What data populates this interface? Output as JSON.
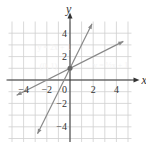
{
  "chart_data": {
    "type": "line",
    "title": "",
    "xlabel": "x",
    "ylabel": "y",
    "xlim": [
      -5.3,
      5.3
    ],
    "ylim": [
      -5.3,
      5.0
    ],
    "grid": true,
    "x_ticks": [
      {
        "v": -4,
        "label": "−4"
      },
      {
        "v": -2,
        "label": "−2"
      },
      {
        "v": 2,
        "label": "2"
      },
      {
        "v": 4,
        "label": "4"
      }
    ],
    "y_ticks": [
      {
        "v": 4,
        "label": "4"
      },
      {
        "v": 2,
        "label": "2"
      },
      {
        "v": -2,
        "label": "−2"
      },
      {
        "v": -4,
        "label": "−4"
      }
    ],
    "origin_label": "0",
    "series": [
      {
        "name": "y = 2x + 1",
        "slope": 2,
        "intercept": 1,
        "x": [
          -2.8,
          1.9
        ],
        "color": "#888888"
      },
      {
        "name": "y = ½x + 1",
        "slope": 0.5,
        "intercept": 1,
        "x": [
          -4.6,
          4.6
        ],
        "color": "#888888"
      }
    ],
    "points": [
      {
        "x": 0,
        "y": 1,
        "label": "(0, 1)"
      }
    ],
    "annotations": [
      {
        "text": "y = 2x + 1",
        "x": -2.8,
        "y": 2.6
      },
      {
        "text": "(0, 1)",
        "x": -2.6,
        "y": 0.9
      },
      {
        "text": "y = ½x + 1",
        "x": 2.0,
        "y": 1.0
      }
    ]
  }
}
